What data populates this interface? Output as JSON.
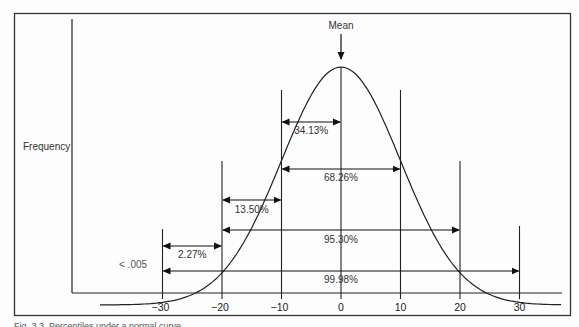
{
  "figure": {
    "ylabel": "Frequency",
    "mean_label": "Mean",
    "tail_label": "< .005",
    "caption": "Fig. 3.3. Percentiles under a normal curve"
  },
  "chart_data": {
    "type": "diagram",
    "xlabel": "",
    "ylabel": "Frequency",
    "x_ticks": [
      -30,
      -20,
      -10,
      0,
      10,
      20,
      30
    ],
    "x_tick_labels": [
      "−30",
      "−20",
      "−10",
      "0",
      "10",
      "20",
      "30"
    ],
    "mean": 0,
    "sd": 10,
    "intervals": [
      {
        "from": -10,
        "to": 0,
        "label": "34.13%"
      },
      {
        "from": -10,
        "to": 10,
        "label": "68.26%"
      },
      {
        "from": -20,
        "to": -10,
        "label": "13.50%"
      },
      {
        "from": -20,
        "to": 20,
        "label": "95.30%"
      },
      {
        "from": -30,
        "to": -20,
        "label": "2.27%"
      },
      {
        "from": -30,
        "to": 30,
        "label": "99.98%"
      }
    ],
    "annotations": [
      "Mean",
      "< .005"
    ],
    "grid": false,
    "legend": null
  }
}
